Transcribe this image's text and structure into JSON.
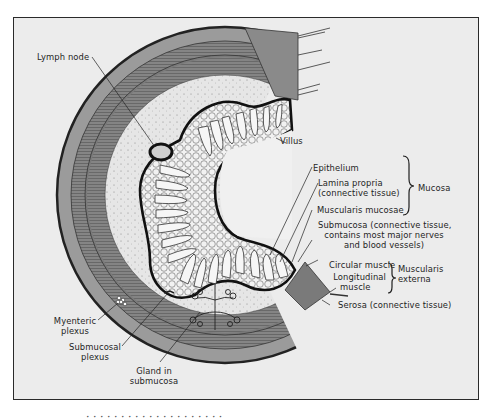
{
  "figure": {
    "colors": {
      "background": "#ececec",
      "frame": "#2a2a2a",
      "serosa": "#9a9a9a",
      "muscle": "#7c7c7c",
      "submucosa": "#e4e4e4",
      "lumen": "#f0f0f0",
      "ink": "#1e1e1e"
    },
    "caption_partial": "· · · · · · · · · · · · · · · · · · · ·"
  },
  "labels": {
    "lymph_node": "Lymph node",
    "villus": "Villus",
    "epithelium": "Epithelium",
    "lamina_propria_1": "Lamina propria",
    "lamina_propria_2": "(connective tissue)",
    "muscularis_mucosae": "Muscularis mucosae",
    "submucosa_1": "Submucosa (connective tissue,",
    "submucosa_2": "contains most major nerves",
    "submucosa_3": "and blood vessels)",
    "circular_muscle": "Circular muscle",
    "longitudinal_1": "Longitudinal",
    "longitudinal_2": "muscle",
    "serosa": "Serosa (connective tissue)",
    "myenteric_1": "Myenteric",
    "myenteric_2": "plexus",
    "submucosal_plexus_1": "Submucosal",
    "submucosal_plexus_2": "plexus",
    "gland_1": "Gland in",
    "gland_2": "submucosa"
  },
  "groups": {
    "mucosa": "Mucosa",
    "muscularis_1": "Muscularis",
    "muscularis_2": "externa"
  }
}
